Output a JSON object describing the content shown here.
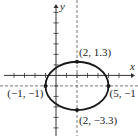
{
  "diagram": {
    "type": "ellipse-graph",
    "axes": {
      "x_label": "x",
      "y_label": "y",
      "x_range": [
        -5,
        7
      ],
      "y_range": [
        -5,
        7
      ]
    },
    "ellipse": {
      "center": [
        2,
        -1
      ],
      "semi_major_x": 3,
      "semi_minor_y": 2.3
    },
    "points": [
      {
        "x": 2,
        "y": 1.3,
        "label": "(2, 1.3)",
        "anchor": "top"
      },
      {
        "x": -1,
        "y": -1,
        "label": "(−1, −1)",
        "anchor": "left"
      },
      {
        "x": 5,
        "y": -1,
        "label": "(5, −1",
        "anchor": "right"
      },
      {
        "x": 2,
        "y": -3.3,
        "label": "(2, −3.3)",
        "anchor": "bottom"
      }
    ],
    "colors": {
      "curve": "#1a1a1a",
      "axis": "#333333",
      "dash": "#555555"
    }
  }
}
